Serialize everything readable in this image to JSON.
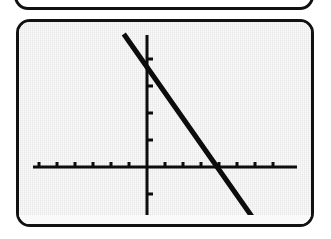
{
  "device": {
    "kind": "graphing-calculator",
    "screen_background": "#e8e8e8",
    "ink_color": "#0d0d0d",
    "bezel_color": "#121212",
    "partial_screen_above_label": "",
    "status_strip_label": ""
  },
  "chart_data": {
    "type": "line",
    "title": "",
    "subtitle": "",
    "xlabel": "",
    "ylabel": "",
    "grid": false,
    "legend": null,
    "legend_position": "none",
    "axis_style": "calculator-crosshair",
    "xlim": [
      -8,
      8
    ],
    "ylim": [
      -5.5,
      5.5
    ],
    "x_tick_step": 1,
    "y_tick_step": 1,
    "x_ticks": [
      -7,
      -6,
      -5,
      -4,
      -3,
      -2,
      -1,
      1,
      2,
      3,
      4,
      5,
      6,
      7
    ],
    "y_ticks": [
      -3,
      -2,
      -1,
      1,
      2,
      3,
      4
    ],
    "tick_labels_visible": false,
    "series": [
      {
        "name": "Y1",
        "style": "solid",
        "slope": -0.95,
        "intercept": 3.7,
        "x_intercept": 3.9,
        "y_intercept": 3.7,
        "x": [
          -7.1,
          -4,
          -2,
          0,
          2,
          3.9,
          6,
          7.6
        ],
        "y": [
          4.5,
          1.5,
          -0.4,
          3.7,
          1.8,
          0,
          -2.0,
          -3.5
        ],
        "points": [
          {
            "x": -7.1,
            "y": 4.5
          },
          {
            "x": 0,
            "y": 3.7
          },
          {
            "x": 3.9,
            "y": 0
          },
          {
            "x": 7.6,
            "y": -3.5
          }
        ]
      }
    ]
  }
}
